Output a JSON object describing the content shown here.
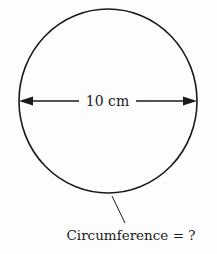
{
  "diagram": {
    "shape": "circle",
    "diameter_label": "10 cm",
    "circumference_label": "Circumference = ?",
    "colors": {
      "stroke": "#1a1a1a",
      "background": "#fdfdfd"
    }
  }
}
